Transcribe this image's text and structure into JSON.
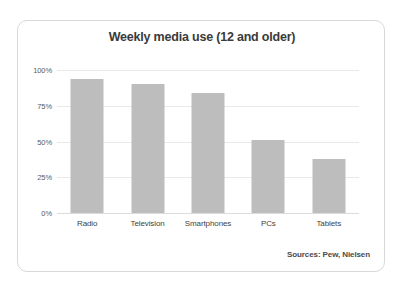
{
  "card": {
    "source_note": "Sources: Pew, Nielsen",
    "border_color": "#d8d8d8",
    "background": "#ffffff"
  },
  "chart_data": {
    "type": "bar",
    "title": "Weekly media use (12 and older)",
    "xlabel": "",
    "ylabel": "",
    "categories": [
      "Radio",
      "Television",
      "Smartphones",
      "PCs",
      "Tablets"
    ],
    "values": [
      94,
      90,
      84,
      51,
      38
    ],
    "value_labels": [
      "94%",
      "90%",
      "84%",
      "51%",
      "38%"
    ],
    "ylim": [
      0,
      100
    ],
    "ytick_values": [
      100,
      75,
      50,
      25,
      0
    ],
    "ytick_labels": [
      "100%",
      "75%",
      "50%",
      "25%",
      "0%"
    ],
    "grid": true,
    "grid_axis": "y",
    "legend": false,
    "bar_color": "#bdbdbd",
    "gridline_color": "#e9e9e9",
    "annotations": [
      "Sources: Pew, Nielsen"
    ]
  }
}
